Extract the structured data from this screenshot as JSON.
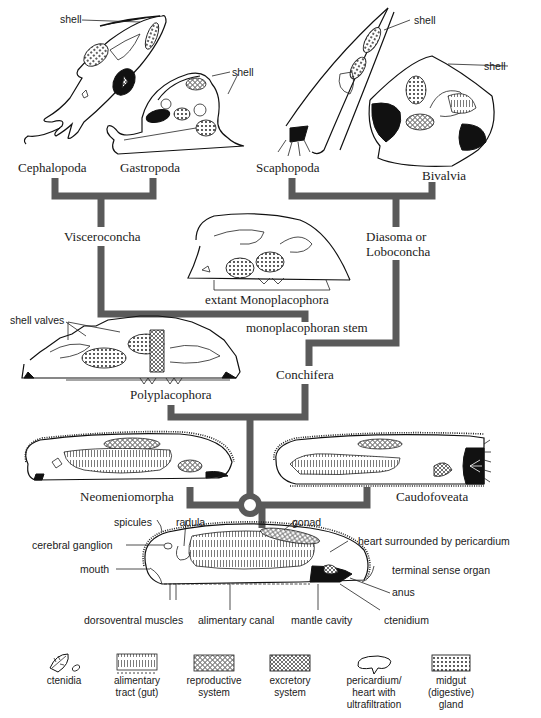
{
  "taxa": {
    "cephalopoda": "Cephalopoda",
    "gastropoda": "Gastropoda",
    "scaphopoda": "Scaphopoda",
    "bivalvia": "Bivalvia",
    "visceroconcha": "Visceroconcha",
    "diasoma_line1": "Diasoma or",
    "diasoma_line2": "Loboconcha",
    "monoplacophora": "extant Monoplacophora",
    "mono_stem": "monoplacophoran stem",
    "conchifera": "Conchifera",
    "polyplacophora": "Polyplacophora",
    "neomeniomorpha": "Neomeniomorpha",
    "caudofoveata": "Caudofoveata"
  },
  "callouts": {
    "shell": "shell",
    "shell_valves": "shell valves"
  },
  "ancestor_labels": {
    "spicules": "spicules",
    "radula": "radula",
    "gonad": "gonad",
    "heart": "heart surrounded by pericardium",
    "cerebral_ganglion": "cerebral ganglion",
    "terminal_sense_organ": "terminal sense organ",
    "mouth": "mouth",
    "anus": "anus",
    "dorsoventral_muscles": "dorsoventral muscles",
    "alimentary_canal": "alimentary canal",
    "mantle_cavity": "mantle cavity",
    "ctenidium": "ctenidium"
  },
  "legend": [
    {
      "icon": "ctenidia-icon",
      "line1": "ctenidia",
      "line2": "",
      "line3": ""
    },
    {
      "icon": "alimentary-tract-icon",
      "line1": "alimentary",
      "line2": "tract (gut)",
      "line3": ""
    },
    {
      "icon": "reproductive-system-icon",
      "line1": "reproductive",
      "line2": "system",
      "line3": ""
    },
    {
      "icon": "excretory-system-icon",
      "line1": "excretory",
      "line2": "system",
      "line3": ""
    },
    {
      "icon": "pericardium-icon",
      "line1": "pericardium/",
      "line2": "heart with",
      "line3": "ultrafiltration"
    },
    {
      "icon": "midgut-gland-icon",
      "line1": "midgut",
      "line2": "(digestive)",
      "line3": "gland"
    }
  ],
  "colors": {
    "tree_lines": "#5a5a5a",
    "ink": "#111111",
    "background": "#ffffff"
  }
}
